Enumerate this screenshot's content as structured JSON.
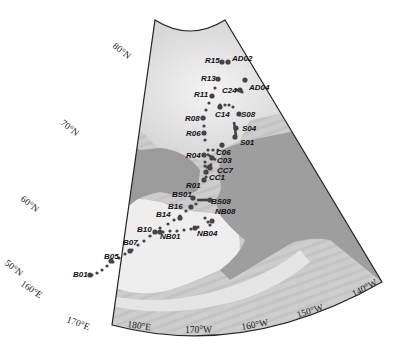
{
  "map": {
    "projection": "conic sector",
    "colors": {
      "ocean": "#cfcfcf",
      "shelf": "#ececec",
      "land": "#9e9e9e",
      "station": "#444444",
      "border": "#222222"
    },
    "latitude_labels": [
      {
        "id": "lat-80",
        "text": "80°N",
        "x": 112,
        "y": 47,
        "rot": 38
      },
      {
        "id": "lat-70",
        "text": "70°N",
        "x": 60,
        "y": 124,
        "rot": 38
      },
      {
        "id": "lat-60",
        "text": "60°N",
        "x": 20,
        "y": 200,
        "rot": 38
      },
      {
        "id": "lat-50",
        "text": "50°N",
        "x": 4,
        "y": 264,
        "rot": 38
      }
    ],
    "longitude_labels": [
      {
        "id": "lon-160e",
        "text": "160°E",
        "x": 20,
        "y": 285,
        "rot": 35
      },
      {
        "id": "lon-170e",
        "text": "170°E",
        "x": 66,
        "y": 322,
        "rot": 20
      },
      {
        "id": "lon-180e",
        "text": "180°E",
        "x": 127,
        "y": 327,
        "rot": 8
      },
      {
        "id": "lon-170w",
        "text": "170°W",
        "x": 185,
        "y": 333,
        "rot": 0
      },
      {
        "id": "lon-160w",
        "text": "160°W",
        "x": 242,
        "y": 330,
        "rot": -10
      },
      {
        "id": "lon-150w",
        "text": "150°W",
        "x": 298,
        "y": 318,
        "rot": -18
      },
      {
        "id": "lon-140w",
        "text": "140°W",
        "x": 354,
        "y": 297,
        "rot": -28
      }
    ],
    "stations": [
      {
        "id": "AD02",
        "label": "AD02",
        "x": 228,
        "y": 62,
        "lx": 232,
        "ly": 61
      },
      {
        "id": "R15",
        "label": "R15",
        "x": 222,
        "y": 62,
        "lx": 205,
        "ly": 63
      },
      {
        "id": "R13",
        "label": "R13",
        "x": 218,
        "y": 79,
        "lx": 201,
        "ly": 81
      },
      {
        "id": "AD04",
        "label": "AD04",
        "x": 245,
        "y": 80,
        "lx": 249,
        "ly": 90
      },
      {
        "id": "C24",
        "label": "C24",
        "x": 240,
        "y": 90,
        "lx": 222,
        "ly": 93
      },
      {
        "id": "R11",
        "label": "R11",
        "x": 212,
        "y": 96,
        "lx": 194,
        "ly": 97
      },
      {
        "id": "C14",
        "label": "C14",
        "x": 220,
        "y": 107,
        "lx": 215,
        "ly": 117
      },
      {
        "id": "S08",
        "label": "S08",
        "x": 239,
        "y": 114,
        "lx": 241,
        "ly": 117
      },
      {
        "id": "R08",
        "label": "R08",
        "x": 203,
        "y": 118,
        "lx": 185,
        "ly": 121
      },
      {
        "id": "S04",
        "label": "S04",
        "x": 236,
        "y": 128,
        "lx": 242,
        "ly": 131
      },
      {
        "id": "R06",
        "label": "R06",
        "x": 204,
        "y": 133,
        "lx": 186,
        "ly": 136
      },
      {
        "id": "S01",
        "label": "S01",
        "x": 235,
        "y": 137,
        "lx": 240,
        "ly": 145
      },
      {
        "id": "C06",
        "label": "C06",
        "x": 222,
        "y": 145,
        "lx": 216,
        "ly": 155
      },
      {
        "id": "C03",
        "label": "C03",
        "x": 212,
        "y": 158,
        "lx": 217,
        "ly": 163
      },
      {
        "id": "R04",
        "label": "R04",
        "x": 204,
        "y": 155,
        "lx": 186,
        "ly": 158
      },
      {
        "id": "CC7",
        "label": "CC7",
        "x": 210,
        "y": 168,
        "lx": 217,
        "ly": 173
      },
      {
        "id": "CC1",
        "label": "CC1",
        "x": 206,
        "y": 172,
        "lx": 209,
        "ly": 180
      },
      {
        "id": "R01",
        "label": "R01",
        "x": 204,
        "y": 180,
        "lx": 186,
        "ly": 188
      },
      {
        "id": "BS01",
        "label": "BS01",
        "x": 193,
        "y": 198,
        "lx": 172,
        "ly": 197
      },
      {
        "id": "BS08",
        "label": "BS08",
        "x": 210,
        "y": 200,
        "lx": 211,
        "ly": 204
      },
      {
        "id": "B16",
        "label": "B16",
        "x": 191,
        "y": 207,
        "lx": 168,
        "ly": 209
      },
      {
        "id": "NB08",
        "label": "NB08",
        "x": 212,
        "y": 221,
        "lx": 215,
        "ly": 214
      },
      {
        "id": "B14",
        "label": "B14",
        "x": 180,
        "y": 218,
        "lx": 156,
        "ly": 217
      },
      {
        "id": "B10",
        "label": "B10",
        "x": 155,
        "y": 232,
        "lx": 137,
        "ly": 232
      },
      {
        "id": "NB01",
        "label": "NB01",
        "x": 160,
        "y": 232,
        "lx": 160,
        "ly": 239
      },
      {
        "id": "NB04",
        "label": "NB04",
        "x": 195,
        "y": 228,
        "lx": 197,
        "ly": 236
      },
      {
        "id": "B07",
        "label": "B07",
        "x": 130,
        "y": 251,
        "lx": 123,
        "ly": 245
      },
      {
        "id": "B05",
        "label": "B05",
        "x": 111,
        "y": 261,
        "lx": 104,
        "ly": 259
      },
      {
        "id": "B01",
        "label": "B01",
        "x": 90,
        "y": 275,
        "lx": 73,
        "ly": 277
      }
    ],
    "track_points": [
      [
        92,
        275
      ],
      [
        97,
        273
      ],
      [
        102,
        270
      ],
      [
        107,
        266
      ],
      [
        113,
        262
      ],
      [
        119,
        258
      ],
      [
        125,
        254
      ],
      [
        132,
        250
      ],
      [
        138,
        245
      ],
      [
        144,
        241
      ],
      [
        150,
        236
      ],
      [
        156,
        232
      ],
      [
        163,
        232
      ],
      [
        170,
        231
      ],
      [
        177,
        231
      ],
      [
        184,
        230
      ],
      [
        191,
        229
      ],
      [
        198,
        227
      ],
      [
        160,
        228
      ],
      [
        168,
        224
      ],
      [
        174,
        220
      ],
      [
        180,
        216
      ],
      [
        186,
        211
      ],
      [
        191,
        207
      ],
      [
        196,
        204
      ],
      [
        205,
        218
      ],
      [
        208,
        222
      ],
      [
        210,
        225
      ],
      [
        206,
        177
      ],
      [
        205,
        166
      ],
      [
        205,
        162
      ],
      [
        208,
        150
      ],
      [
        213,
        150
      ],
      [
        218,
        150
      ],
      [
        222,
        146
      ],
      [
        205,
        140
      ],
      [
        204,
        133
      ],
      [
        204,
        126
      ],
      [
        204,
        118
      ],
      [
        206,
        110
      ],
      [
        209,
        103
      ],
      [
        212,
        96
      ],
      [
        215,
        88
      ],
      [
        218,
        79
      ],
      [
        222,
        62
      ],
      [
        225,
        105
      ],
      [
        229,
        105
      ],
      [
        233,
        107
      ],
      [
        220,
        105
      ],
      [
        237,
        90
      ],
      [
        242,
        92
      ]
    ]
  }
}
